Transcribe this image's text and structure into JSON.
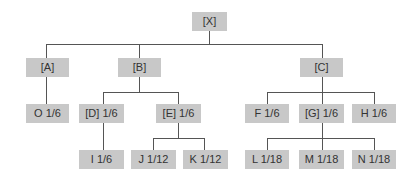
{
  "diagram": {
    "type": "tree",
    "root": "[X]",
    "nodes": [
      {
        "id": "X",
        "label": "[X]",
        "parent": null
      },
      {
        "id": "A",
        "label": "[A]",
        "parent": "X"
      },
      {
        "id": "B",
        "label": "[B]",
        "parent": "X"
      },
      {
        "id": "C",
        "label": "[C]",
        "parent": "X"
      },
      {
        "id": "O",
        "label": "O 1/6",
        "parent": "A"
      },
      {
        "id": "D",
        "label": "[D] 1/6",
        "parent": "B"
      },
      {
        "id": "E",
        "label": "[E] 1/6",
        "parent": "B"
      },
      {
        "id": "F",
        "label": "F 1/6",
        "parent": "C"
      },
      {
        "id": "G",
        "label": "[G] 1/6",
        "parent": "C"
      },
      {
        "id": "H",
        "label": "H 1/6",
        "parent": "C"
      },
      {
        "id": "I",
        "label": "I 1/6",
        "parent": "D"
      },
      {
        "id": "J",
        "label": "J 1/12",
        "parent": "E"
      },
      {
        "id": "K",
        "label": "K 1/12",
        "parent": "E"
      },
      {
        "id": "L",
        "label": "L 1/18",
        "parent": "G"
      },
      {
        "id": "M",
        "label": "M 1/18",
        "parent": "G"
      },
      {
        "id": "N",
        "label": "N 1/18",
        "parent": "G"
      }
    ]
  },
  "labels": {
    "X": "[X]",
    "A": "[A]",
    "B": "[B]",
    "C": "[C]",
    "O": "O 1/6",
    "D": "[D] 1/6",
    "E": "[E] 1/6",
    "F": "F 1/6",
    "G": "[G] 1/6",
    "H": "H 1/6",
    "I": "I 1/6",
    "J": "J 1/12",
    "K": "K 1/12",
    "L": "L 1/18",
    "M": "M 1/18",
    "N": "N 1/18"
  },
  "colors": {
    "node_fill": "#c8c8c8",
    "line": "#555555",
    "text": "#333333"
  }
}
